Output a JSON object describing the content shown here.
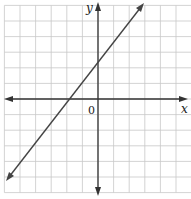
{
  "graph": {
    "x_axis_label": "x",
    "y_axis_label": "y",
    "origin_label": "0",
    "grid": {
      "columns": 12,
      "rows": 12,
      "x_min": -6,
      "x_max": 6,
      "y_min": -6,
      "y_max": 6,
      "step": 1
    },
    "colors": {
      "grid": "#c8c8c8",
      "axes": "#333333",
      "line": "#444444",
      "background": "#ffffff"
    },
    "line": {
      "equation": "y = x + 2",
      "slope": 1,
      "y_intercept": 2,
      "x_intercept": -2,
      "arrows": "both"
    }
  }
}
